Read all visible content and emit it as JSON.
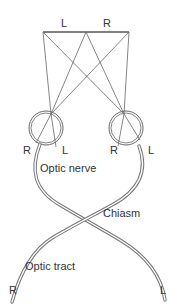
{
  "diagram": {
    "visual_field": {
      "left_label": "L",
      "right_label": "R"
    },
    "left_eye": {
      "left_retina_label": "R",
      "right_retina_label": "L"
    },
    "right_eye": {
      "left_retina_label": "R",
      "right_retina_label": "L"
    },
    "labels": {
      "optic_nerve": "Optic nerve",
      "chiasm": "Chiasm",
      "optic_tract": "Optic tract",
      "tract_end_left": "R",
      "tract_end_right": "L"
    },
    "colors": {
      "line": "#555555",
      "nerve": "#777777",
      "text": "#333333"
    }
  }
}
